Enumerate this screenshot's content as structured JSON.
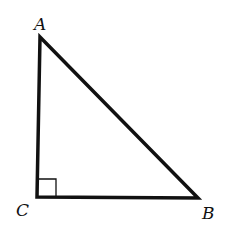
{
  "diagram": {
    "type": "right-triangle",
    "stroke_color": "#111111",
    "background": "#ffffff",
    "vertices": [
      {
        "name": "A",
        "label": "A",
        "x": 40,
        "y": 37,
        "label_x": 34,
        "label_y": 30
      },
      {
        "name": "B",
        "label": "B",
        "x": 198,
        "y": 198,
        "label_x": 202,
        "label_y": 219
      },
      {
        "name": "C",
        "label": "C",
        "x": 37,
        "y": 197,
        "label_x": 16,
        "label_y": 216
      }
    ],
    "right_angle_at": "C",
    "right_angle_marker_size": 19
  }
}
